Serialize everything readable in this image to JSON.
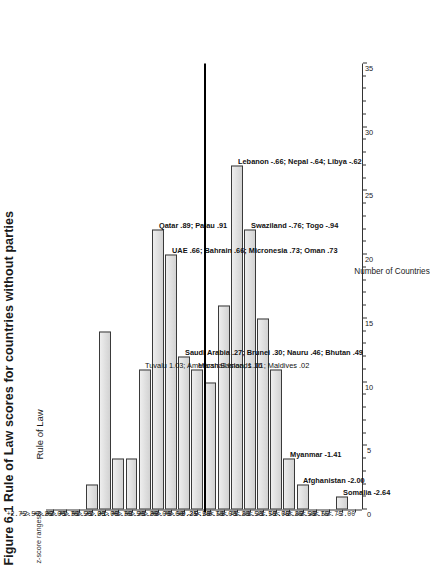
{
  "figure": {
    "caption": "Figure 6.1 Rule of Law scores for countries without parties",
    "panel_title": "Rule of Law",
    "zscore_header": "z-score ranges",
    "xaxis_title": "Number of Countries"
  },
  "axis": {
    "ticks": [
      0,
      5,
      10,
      15,
      20,
      25,
      30,
      35
    ],
    "min": 0,
    "max": 35
  },
  "chart_data": {
    "type": "bar",
    "orientation": "horizontal",
    "title": "Rule of Law",
    "xlabel": "Number of Countries",
    "ylabel": "z-score ranges",
    "xlim": [
      0,
      35
    ],
    "grid": false,
    "legend": "none",
    "categories": [
      "+2.75> +3.00",
      "+2.50> +2.75",
      "+2.25> +2.50",
      "+2.00> +2.25",
      "+1.75> +2.00",
      "+1.50> +1.75",
      "+1.25> +1.50",
      "+1.00> +1.25",
      "+0.75> +1.00",
      "+0.50> +0.75",
      "+0.25> +0.50",
      "+0.00> +0.25",
      "0.00 - 0.25",
      "-0.25< -0.50",
      "-0.50< -0.75",
      "-0.75< -1.00",
      "-1.00< -1.25",
      "-1.25< -1.50",
      "-1.50< -1.75",
      "-1.75< -2.00",
      "-2.00< -2.25",
      "-2.25< -2.50",
      "-2.50< -2.75",
      "-2.75< -3.00"
    ],
    "values": [
      0,
      0,
      0,
      2,
      14,
      4,
      4,
      11,
      22,
      20,
      12,
      11,
      10,
      16,
      27,
      22,
      15,
      11,
      4,
      2,
      0,
      0,
      1,
      0
    ],
    "annotations": [
      {
        "category_index": 7,
        "text": "Tuvalu 1.03; American Samoa, 1.16",
        "bold": false
      },
      {
        "category_index": 8,
        "text": "Qatar .89; Palau .91",
        "bold": true,
        "bold_prefix": "Qatar .89;"
      },
      {
        "category_index": 9,
        "text": "UAE .66; Bahrain .66; Micronesia .73; Oman .73",
        "bold": true
      },
      {
        "category_index": 10,
        "text": "Saudi Arabia .27; Brunei .30; Nauru .46; Bhutan .49",
        "bold": true
      },
      {
        "category_index": 11,
        "text": "Marshall Islands .01; Maldives .02",
        "bold": false
      },
      {
        "category_index": 14,
        "text": "Lebanon -.66; Nepal -.64; Libya -.62",
        "bold": true
      },
      {
        "category_index": 15,
        "text": "Swaziland -.76; Togo -.94",
        "bold": true
      },
      {
        "category_index": 18,
        "text": "Myanmar -1.41",
        "bold": true
      },
      {
        "category_index": 19,
        "text": "Afghanistan -2.00",
        "bold": true
      },
      {
        "category_index": 22,
        "text": "Somalia -2.64",
        "bold": true
      }
    ],
    "divider_after_index": 11
  },
  "colors": {
    "bar_fill": "#d9d9d9",
    "bar_stroke": "#3a3a3a",
    "axis": "#333333",
    "divider": "#000000",
    "text": "#1a1a1a"
  }
}
